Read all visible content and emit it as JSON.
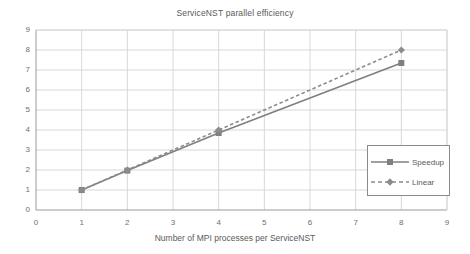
{
  "chart_data": {
    "type": "line",
    "title": "ServiceNST parallel efficiency",
    "xlabel": "Number of MPI processes per ServiceNST",
    "ylabel": "",
    "xlim": [
      0,
      9
    ],
    "ylim": [
      0,
      9
    ],
    "xticks": [
      0,
      1,
      2,
      3,
      4,
      5,
      6,
      7,
      8,
      9
    ],
    "yticks": [
      0,
      1,
      2,
      3,
      4,
      5,
      6,
      7,
      8,
      9
    ],
    "xtick_labels": [
      "0",
      "1",
      "2",
      "3",
      "4",
      "5",
      "6",
      "7",
      "8",
      "9"
    ],
    "ytick_labels": [
      "0",
      "1",
      "2",
      "3",
      "4",
      "5",
      "6",
      "7",
      "8",
      "9"
    ],
    "grid": true,
    "legend_position": "right-middle",
    "x": [
      1,
      2,
      4,
      8
    ],
    "series": [
      {
        "name": "Speedup",
        "values": [
          1,
          1.97,
          3.85,
          7.35
        ],
        "color": "#7f7f7f",
        "line_style": "solid",
        "marker": "square"
      },
      {
        "name": "Linear",
        "values": [
          1,
          2,
          4,
          8
        ],
        "color": "#8c8c8c",
        "line_style": "dashed",
        "marker": "diamond"
      }
    ]
  },
  "legend": {
    "items": [
      {
        "label": "Speedup"
      },
      {
        "label": "Linear"
      }
    ]
  },
  "colors": {
    "background": "#ffffff",
    "grid": "#d8d8d8",
    "axis": "#9a9a9a",
    "text": "#5a5a5a",
    "speedup": "#7f7f7f",
    "linear": "#8c8c8c"
  }
}
